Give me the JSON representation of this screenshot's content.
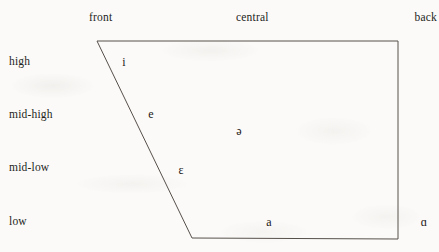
{
  "figure": {
    "type": "vowel-quadrilateral",
    "background_color": "#fbfaf8",
    "line_color": "#56504b",
    "text_color": "#1d1b19"
  },
  "column_headers": [
    {
      "id": "front",
      "label": "front"
    },
    {
      "id": "central",
      "label": "central"
    },
    {
      "id": "back",
      "label": "back"
    }
  ],
  "row_labels": [
    {
      "id": "high",
      "label": "high"
    },
    {
      "id": "mid-high",
      "label": "mid-high"
    },
    {
      "id": "mid-low",
      "label": "mid-low"
    },
    {
      "id": "low",
      "label": "low"
    }
  ],
  "chart_data": {
    "type": "scatter",
    "title": "",
    "subtitle": "",
    "xlabel": "",
    "ylabel": "",
    "grid": false,
    "legend": null,
    "x_axis": {
      "position": "top",
      "tick_labels": [
        "front",
        "central",
        "back"
      ],
      "tick_x_px": [
        107,
        255,
        420
      ]
    },
    "y_axis": {
      "position": "left",
      "tick_labels": [
        "high",
        "mid-high",
        "mid-low",
        "low"
      ],
      "tick_y_px": [
        62,
        115,
        168,
        222
      ]
    },
    "outline": {
      "shape": "trapezoid",
      "closed": true,
      "vertices_px": [
        {
          "x": 97,
          "y": 41,
          "corner": "high-front"
        },
        {
          "x": 398,
          "y": 41,
          "corner": "high-back"
        },
        {
          "x": 398,
          "y": 239,
          "corner": "low-back"
        },
        {
          "x": 192,
          "y": 238,
          "corner": "low-front"
        }
      ],
      "stroke_width_px": 1
    },
    "points": [
      {
        "symbol": "i",
        "name": "close-front-unrounded",
        "height": "high",
        "backness": "front",
        "x_px": 124,
        "y_px": 62
      },
      {
        "symbol": "e",
        "name": "close-mid-front-unrounded",
        "height": "mid-high",
        "backness": "front",
        "x_px": 151,
        "y_px": 114
      },
      {
        "symbol": "ɛ",
        "name": "open-mid-front-unrounded",
        "height": "mid-low",
        "backness": "front",
        "x_px": 181,
        "y_px": 170
      },
      {
        "symbol": "ə",
        "name": "mid-central-schwa",
        "height": "mid-high",
        "backness": "central",
        "x_px": 239,
        "y_px": 131
      },
      {
        "symbol": "a",
        "name": "open-front-unrounded",
        "height": "low",
        "backness": "central",
        "x_px": 269,
        "y_px": 222
      },
      {
        "symbol": "ɑ",
        "name": "open-back-unrounded",
        "height": "low",
        "backness": "back",
        "x_px": 424,
        "y_px": 222
      }
    ]
  }
}
